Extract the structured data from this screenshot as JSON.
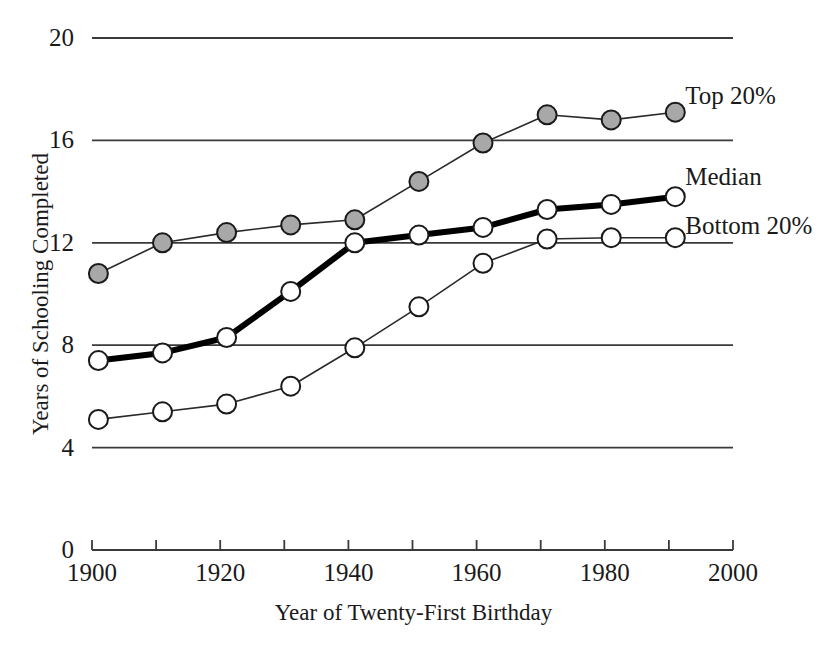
{
  "chart_data": {
    "type": "line",
    "title": "",
    "xlabel": "Year of Twenty-First Birthday",
    "ylabel": "Years of Schooling Completed",
    "xlim": [
      1900,
      2000
    ],
    "ylim": [
      0,
      20
    ],
    "xticks": [
      1900,
      1910,
      1920,
      1930,
      1940,
      1950,
      1960,
      1970,
      1980,
      1990,
      2000
    ],
    "xtick_labels": [
      "1900",
      "",
      "1920",
      "",
      "1940",
      "",
      "1960",
      "",
      "1980",
      "",
      "2000"
    ],
    "yticks": [
      0,
      4,
      8,
      12,
      16,
      20
    ],
    "ytick_labels": [
      "0",
      "4",
      "8",
      "12",
      "16",
      "20"
    ],
    "grid": "horizontal",
    "legend_position": "right-inline",
    "x": [
      1901,
      1911,
      1921,
      1931,
      1941,
      1951,
      1961,
      1971,
      1981,
      1991
    ],
    "series": [
      {
        "name": "Top 20%",
        "label": "Top 20%",
        "marker": "filled-circle",
        "marker_color": "#a8a8a8",
        "line_color": "#2a2a2a",
        "line_width": 1.6,
        "values": [
          10.8,
          12.0,
          12.4,
          12.7,
          12.9,
          14.4,
          15.9,
          17.0,
          16.8,
          17.1
        ]
      },
      {
        "name": "Median",
        "label": "Median",
        "marker": "open-circle",
        "marker_color": "#ffffff",
        "line_color": "#000000",
        "line_width": 6.0,
        "values": [
          7.4,
          7.7,
          8.3,
          10.1,
          12.0,
          12.3,
          12.6,
          13.3,
          13.5,
          13.8
        ]
      },
      {
        "name": "Bottom 20%",
        "label": "Bottom 20%",
        "marker": "open-circle",
        "marker_color": "#ffffff",
        "line_color": "#2a2a2a",
        "line_width": 1.6,
        "values": [
          5.1,
          5.4,
          5.7,
          6.4,
          7.9,
          9.5,
          11.2,
          12.15,
          12.2,
          12.2
        ]
      }
    ]
  },
  "axes": {
    "y_axis_title": "Years of Schooling Completed",
    "x_axis_title": "Year of Twenty-First Birthday"
  },
  "labels": {
    "top": "Top 20%",
    "median": "Median",
    "bottom": "Bottom 20%"
  }
}
